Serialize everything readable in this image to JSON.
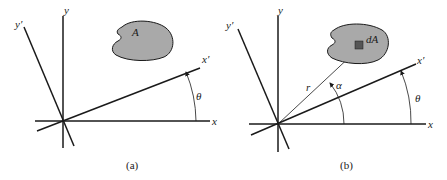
{
  "figure": {
    "panels": [
      {
        "id": "a",
        "caption": "(a)",
        "labels": {
          "y": "y",
          "y_prime": "y′",
          "x": "x",
          "x_prime": "x′",
          "theta": "θ",
          "area": "A"
        }
      },
      {
        "id": "b",
        "caption": "(b)",
        "labels": {
          "y": "y",
          "y_prime": "y′",
          "x": "x",
          "x_prime": "x′",
          "theta": "θ",
          "alpha": "α",
          "r": "r",
          "dA": "dA"
        }
      }
    ],
    "colors": {
      "line": "#1a1a1a",
      "area_fill": "#a9a9a9",
      "element_fill": "#555555",
      "background": "#ffffff"
    }
  }
}
